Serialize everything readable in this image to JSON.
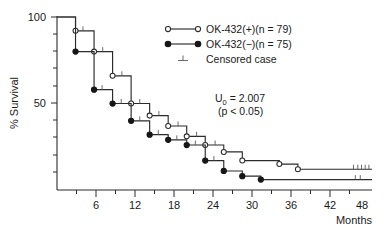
{
  "chart_data": {
    "type": "line",
    "title": "",
    "xlabel": "Months",
    "ylabel": "% Survival",
    "xlim": [
      0,
      51
    ],
    "ylim": [
      0,
      100
    ],
    "xticks": [
      6,
      12,
      18,
      24,
      30,
      36,
      42,
      48
    ],
    "xtick_labels": [
      "6",
      "12",
      "18",
      "24",
      "30",
      "36",
      "42",
      "48"
    ],
    "yticks": [
      50,
      100
    ],
    "ytick_labels": [
      "50",
      "100"
    ],
    "yminor_ticks": [
      10,
      20,
      30,
      40,
      60,
      70,
      80,
      90
    ],
    "grid": false,
    "legend_position": "upper-right",
    "series": [
      {
        "name": "OK-432(+)(n = 79)",
        "marker": "open-circle",
        "steps": [
          {
            "x": 0,
            "y": 100
          },
          {
            "x": 3,
            "y": 100
          },
          {
            "x": 3,
            "y": 92
          },
          {
            "x": 6,
            "y": 92
          },
          {
            "x": 6,
            "y": 80
          },
          {
            "x": 9,
            "y": 80
          },
          {
            "x": 9,
            "y": 66
          },
          {
            "x": 12,
            "y": 66
          },
          {
            "x": 12,
            "y": 50
          },
          {
            "x": 15,
            "y": 50
          },
          {
            "x": 15,
            "y": 43
          },
          {
            "x": 18,
            "y": 43
          },
          {
            "x": 18,
            "y": 37
          },
          {
            "x": 21,
            "y": 37
          },
          {
            "x": 21,
            "y": 31
          },
          {
            "x": 24,
            "y": 31
          },
          {
            "x": 24,
            "y": 26
          },
          {
            "x": 27,
            "y": 26
          },
          {
            "x": 27,
            "y": 22
          },
          {
            "x": 30,
            "y": 22
          },
          {
            "x": 30,
            "y": 17
          },
          {
            "x": 36,
            "y": 17
          },
          {
            "x": 36,
            "y": 15
          },
          {
            "x": 39,
            "y": 15
          },
          {
            "x": 39,
            "y": 12
          },
          {
            "x": 51,
            "y": 12
          }
        ],
        "censored": [
          {
            "x": 4.2,
            "y": 92
          },
          {
            "x": 7.4,
            "y": 80
          },
          {
            "x": 10.5,
            "y": 66
          },
          {
            "x": 13.4,
            "y": 50
          },
          {
            "x": 16.5,
            "y": 43
          },
          {
            "x": 19.6,
            "y": 37
          },
          {
            "x": 22.6,
            "y": 31
          },
          {
            "x": 25.6,
            "y": 26
          },
          {
            "x": 48.0,
            "y": 12
          },
          {
            "x": 48.7,
            "y": 12
          },
          {
            "x": 49.3,
            "y": 12
          },
          {
            "x": 49.9,
            "y": 12
          },
          {
            "x": 50.5,
            "y": 12
          }
        ]
      },
      {
        "name": "OK-432(−)(n = 75)",
        "marker": "filled-circle",
        "steps": [
          {
            "x": 0,
            "y": 100
          },
          {
            "x": 3,
            "y": 100
          },
          {
            "x": 3,
            "y": 80
          },
          {
            "x": 6,
            "y": 80
          },
          {
            "x": 6,
            "y": 58
          },
          {
            "x": 9,
            "y": 58
          },
          {
            "x": 9,
            "y": 50
          },
          {
            "x": 12,
            "y": 50
          },
          {
            "x": 12,
            "y": 40
          },
          {
            "x": 15,
            "y": 40
          },
          {
            "x": 15,
            "y": 32
          },
          {
            "x": 18,
            "y": 32
          },
          {
            "x": 18,
            "y": 29
          },
          {
            "x": 21,
            "y": 29
          },
          {
            "x": 21,
            "y": 26
          },
          {
            "x": 24,
            "y": 26
          },
          {
            "x": 24,
            "y": 17
          },
          {
            "x": 27,
            "y": 17
          },
          {
            "x": 27,
            "y": 11
          },
          {
            "x": 30,
            "y": 11
          },
          {
            "x": 30,
            "y": 8
          },
          {
            "x": 33,
            "y": 8
          },
          {
            "x": 33,
            "y": 6
          },
          {
            "x": 51,
            "y": 6
          }
        ],
        "censored": [
          {
            "x": 7.3,
            "y": 58
          },
          {
            "x": 10.4,
            "y": 50
          },
          {
            "x": 13.4,
            "y": 40
          },
          {
            "x": 16.4,
            "y": 32
          },
          {
            "x": 19.4,
            "y": 29
          },
          {
            "x": 22.4,
            "y": 26
          },
          {
            "x": 25.4,
            "y": 17
          },
          {
            "x": 48.3,
            "y": 6
          },
          {
            "x": 49.1,
            "y": 6
          }
        ]
      }
    ],
    "annotations": [
      {
        "name": "statistic",
        "text": "U₀ = 2.007"
      },
      {
        "name": "p-value",
        "text": "(p < 0.05)"
      }
    ]
  },
  "legend": {
    "items": [
      {
        "label": "OK-432(+)(n = 79)",
        "marker": "open-circle"
      },
      {
        "label": "OK-432(−)(n = 75)",
        "marker": "filled-circle"
      },
      {
        "label": "Censored case",
        "marker": "censor-tick"
      }
    ]
  },
  "statistics": {
    "u_prefix": "U",
    "u_subscript": "0",
    "u_value": " = 2.007",
    "p_value": "(p < 0.05)"
  },
  "axes": {
    "y_title": "% Survival",
    "x_title": "Months",
    "y_labels": [
      "100",
      "50"
    ],
    "x_labels": [
      "6",
      "12",
      "18",
      "24",
      "30",
      "36",
      "42",
      "48"
    ]
  }
}
